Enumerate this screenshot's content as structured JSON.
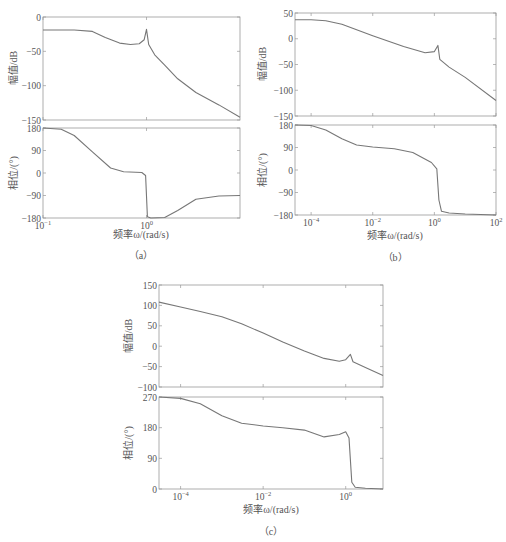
{
  "chart_data": [
    {
      "id": "a",
      "type": "line",
      "caption": "（a）",
      "xlabel": "频率ω/(rad/s)",
      "xscale": "log",
      "xlim": [
        0.1,
        8
      ],
      "xticks": [
        "10^-1",
        "10^0"
      ],
      "subplots": [
        {
          "name": "magnitude",
          "ylabel": "幅值/dB",
          "ylim": [
            -150,
            0
          ],
          "yticks": [
            "0",
            "-50",
            "-100",
            "-150"
          ],
          "x": [
            0.1,
            0.2,
            0.3,
            0.4,
            0.55,
            0.7,
            0.85,
            0.95,
            1.0,
            1.05,
            1.2,
            1.5,
            2.0,
            3.0,
            5.0,
            8.0
          ],
          "y": [
            -19,
            -19,
            -21,
            -30,
            -38,
            -40,
            -39,
            -33,
            -18,
            -40,
            -55,
            -70,
            -90,
            -110,
            -128,
            -146
          ]
        },
        {
          "name": "phase",
          "ylabel": "相位/(°)",
          "ylim": [
            -180,
            180
          ],
          "yticks": [
            "180",
            "90",
            "0",
            "-90",
            "-180"
          ],
          "x": [
            0.1,
            0.15,
            0.2,
            0.3,
            0.45,
            0.6,
            0.9,
            0.98,
            1.02,
            1.1,
            1.5,
            2.0,
            3.0,
            5.0,
            8.0
          ],
          "y": [
            180,
            175,
            150,
            85,
            20,
            5,
            2,
            -10,
            -175,
            -180,
            -178,
            -150,
            -105,
            -92,
            -90
          ]
        }
      ]
    },
    {
      "id": "b",
      "type": "line",
      "caption": "（b）",
      "xlabel": "频率ω/(rad/s)",
      "xscale": "log",
      "xlim": [
        3e-05,
        100
      ],
      "xticks": [
        "10^-4",
        "10^-2",
        "10^0",
        "10^2"
      ],
      "subplots": [
        {
          "name": "magnitude",
          "ylabel": "幅值/dB",
          "ylim": [
            -150,
            50
          ],
          "yticks": [
            "50",
            "0",
            "-50",
            "-100",
            "-150"
          ],
          "x": [
            3e-05,
            0.0001,
            0.0003,
            0.001,
            0.01,
            0.1,
            0.5,
            1.0,
            1.3,
            1.5,
            3,
            10,
            100
          ],
          "y": [
            37,
            37,
            35,
            28,
            6,
            -15,
            -27,
            -25,
            -13,
            -40,
            -55,
            -75,
            -120
          ]
        },
        {
          "name": "phase",
          "ylabel": "相位/(°)",
          "ylim": [
            -180,
            180
          ],
          "yticks": [
            "180",
            "90",
            "0",
            "-90",
            "-180"
          ],
          "x": [
            3e-05,
            0.0001,
            0.0003,
            0.001,
            0.003,
            0.01,
            0.05,
            0.2,
            0.8,
            1.2,
            1.4,
            1.7,
            3,
            10,
            100
          ],
          "y": [
            180,
            178,
            160,
            125,
            100,
            92,
            85,
            70,
            30,
            5,
            -120,
            -165,
            -172,
            -176,
            -180
          ]
        }
      ]
    },
    {
      "id": "c",
      "type": "line",
      "caption": "（c）",
      "xlabel": "频率ω/(rad/s)",
      "xscale": "log",
      "xlim": [
        3e-05,
        8
      ],
      "xticks": [
        "10^-4",
        "10^-2",
        "10^0"
      ],
      "subplots": [
        {
          "name": "magnitude",
          "ylabel": "幅值/dB",
          "ylim": [
            -100,
            150
          ],
          "yticks": [
            "150",
            "100",
            "50",
            "0",
            "-50",
            "-100"
          ],
          "x": [
            3e-05,
            0.0001,
            0.0003,
            0.001,
            0.003,
            0.01,
            0.03,
            0.1,
            0.3,
            0.7,
            1.0,
            1.3,
            1.5,
            3,
            8
          ],
          "y": [
            108,
            96,
            85,
            72,
            55,
            32,
            10,
            -12,
            -30,
            -37,
            -33,
            -20,
            -38,
            -52,
            -72
          ]
        },
        {
          "name": "phase",
          "ylabel": "相位/(°)",
          "ylim": [
            0,
            270
          ],
          "yticks": [
            "270",
            "180",
            "90",
            "0"
          ],
          "x": [
            3e-05,
            0.0001,
            0.0003,
            0.001,
            0.003,
            0.01,
            0.03,
            0.1,
            0.3,
            0.7,
            1.0,
            1.2,
            1.4,
            1.7,
            3,
            8
          ],
          "y": [
            270,
            266,
            250,
            215,
            193,
            185,
            180,
            173,
            153,
            160,
            168,
            150,
            20,
            5,
            2,
            0
          ]
        }
      ]
    }
  ],
  "labels": {
    "a": {
      "caption": "（a）",
      "xlabel": "频率ω/(rad/s)",
      "mag_ylabel": "幅值/dB",
      "phase_ylabel": "相位/(°)"
    },
    "b": {
      "caption": "（b）",
      "xlabel": "频率ω/(rad/s)",
      "mag_ylabel": "幅值/dB",
      "phase_ylabel": "相位/(°)"
    },
    "c": {
      "caption": "（c）",
      "xlabel": "频率ω/(rad/s)",
      "mag_ylabel": "幅值/dB",
      "phase_ylabel": "相位/(°)"
    }
  }
}
